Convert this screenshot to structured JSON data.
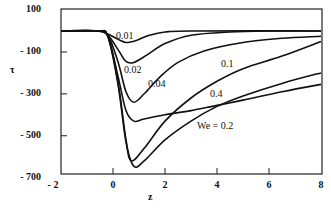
{
  "chart_data": {
    "type": "line",
    "title": "",
    "xlabel": "z",
    "ylabel": "τ",
    "xlim": [
      -2,
      8
    ],
    "ylim": [
      -700,
      150
    ],
    "x_ticks": [
      "- 2",
      "0",
      "2",
      "4",
      "6",
      "8"
    ],
    "y_ticks": [
      "100",
      "- 100",
      "- 300",
      "- 500",
      "- 700"
    ],
    "grid": false,
    "legend": "inline curve labels",
    "series": [
      {
        "name": "0.01",
        "label": "0.01",
        "x": [
          -2,
          -0.6,
          -0.2,
          0.2,
          0.5,
          0.9,
          1.4,
          2.0,
          3,
          8
        ],
        "y": [
          0,
          0,
          -15,
          -40,
          -55,
          -45,
          -20,
          -5,
          0,
          0
        ]
      },
      {
        "name": "0.02",
        "label": "0.02",
        "x": [
          -2,
          -0.6,
          -0.2,
          0.2,
          0.5,
          0.8,
          1.3,
          2.0,
          3.0,
          4.5,
          6,
          8
        ],
        "y": [
          0,
          0,
          -20,
          -90,
          -145,
          -150,
          -115,
          -60,
          -20,
          -5,
          0,
          0
        ]
      },
      {
        "name": "0.04",
        "label": "0.04",
        "x": [
          -2,
          -0.6,
          -0.2,
          0.2,
          0.5,
          0.8,
          1.2,
          1.8,
          2.5,
          3.5,
          5,
          6.5,
          8
        ],
        "y": [
          0,
          0,
          -20,
          -150,
          -290,
          -340,
          -300,
          -220,
          -150,
          -95,
          -55,
          -35,
          -25
        ]
      },
      {
        "name": "0.1",
        "label": "0.1",
        "x": [
          -2,
          -0.6,
          -0.2,
          0.2,
          0.5,
          0.7,
          1.2,
          2,
          3,
          4,
          5,
          6.5,
          8
        ],
        "y": [
          0,
          0,
          -25,
          -250,
          -520,
          -620,
          -560,
          -430,
          -320,
          -240,
          -180,
          -120,
          -50
        ]
      },
      {
        "name": "We = 0.2",
        "label": "We = 0.2",
        "x": [
          -2,
          -0.6,
          -0.2,
          0.2,
          0.5,
          0.8,
          1.2,
          2,
          3,
          4,
          5,
          6.5,
          8
        ],
        "y": [
          0,
          0,
          -25,
          -260,
          -530,
          -645,
          -620,
          -520,
          -430,
          -360,
          -310,
          -250,
          -200
        ]
      },
      {
        "name": "0.4",
        "label": "0.4",
        "x": [
          -2,
          -0.6,
          -0.2,
          0.2,
          0.5,
          0.8,
          1.2,
          2,
          3,
          4,
          5,
          6.5,
          8
        ],
        "y": [
          0,
          0,
          -25,
          -220,
          -380,
          -430,
          -420,
          -400,
          -380,
          -355,
          -330,
          -290,
          -255
        ]
      }
    ]
  }
}
